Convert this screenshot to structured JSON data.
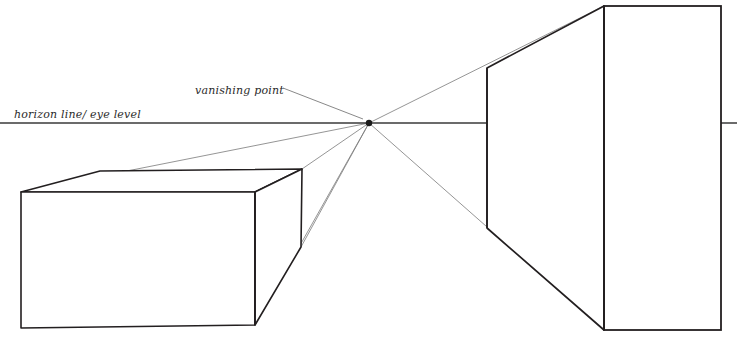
{
  "diagram": {
    "labels": {
      "horizon": "horizon line/ eye level",
      "vanishing_point": "vanishing point"
    },
    "colors": {
      "ink": "#231f20",
      "construction": "#6b6b6b",
      "horizon": "#3a3a3a",
      "background": "#ffffff"
    },
    "canvas": {
      "width": 737,
      "height": 343
    },
    "vanishing_point": {
      "x": 369,
      "y": 123
    },
    "horizon_line": {
      "y": 123,
      "segments": [
        {
          "x1": 0,
          "x2": 487
        },
        {
          "x1": 721,
          "x2": 737
        }
      ]
    },
    "leader_line": {
      "x1": 283,
      "y1": 88,
      "x2": 362,
      "y2": 119
    },
    "left_box": {
      "name": "left-box-below-horizon",
      "front_face": {
        "x1": 21,
        "y1": 192,
        "x2": 255,
        "y2": 325
      },
      "points": {
        "front_top_left": {
          "x": 21,
          "y": 192
        },
        "front_top_right": {
          "x": 255,
          "y": 192
        },
        "front_bottom_right": {
          "x": 255,
          "y": 325
        },
        "front_bottom_left": {
          "x": 21,
          "y": 328
        },
        "back_top_left": {
          "x": 100,
          "y": 171
        },
        "back_top_right": {
          "x": 302,
          "y": 169
        },
        "back_bottom_right": {
          "x": 301,
          "y": 247
        }
      }
    },
    "right_box": {
      "name": "right-box-crossing-horizon",
      "front_face": {
        "x1": 604,
        "y1": 6,
        "x2": 721,
        "y2": 330
      },
      "points": {
        "front_top_left": {
          "x": 604,
          "y": 6
        },
        "front_top_right": {
          "x": 721,
          "y": 6
        },
        "front_bottom_right": {
          "x": 721,
          "y": 330
        },
        "front_bottom_left": {
          "x": 604,
          "y": 330
        },
        "back_top_left": {
          "x": 487,
          "y": 68
        },
        "back_bottom_left": {
          "x": 487,
          "y": 228
        }
      }
    },
    "construction_lines": [
      {
        "name": "vp-to-left-box-top-left",
        "x1": 369,
        "y1": 123,
        "x2": 21,
        "y2": 192
      },
      {
        "name": "vp-to-left-box-back-top-right",
        "x1": 369,
        "y1": 123,
        "x2": 302,
        "y2": 169
      },
      {
        "name": "vp-to-left-box-back-bottom-right",
        "x1": 369,
        "y1": 123,
        "x2": 301,
        "y2": 247
      },
      {
        "name": "vp-to-left-box-front-bottom-right",
        "x1": 369,
        "y1": 123,
        "x2": 255,
        "y2": 325
      },
      {
        "name": "vp-to-right-box-top",
        "x1": 369,
        "y1": 123,
        "x2": 604,
        "y2": 6
      },
      {
        "name": "vp-to-right-box-bottom",
        "x1": 369,
        "y1": 123,
        "x2": 604,
        "y2": 330
      }
    ]
  }
}
